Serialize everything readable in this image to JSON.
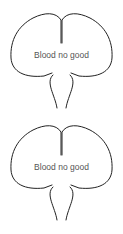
{
  "diagrams": [
    {
      "label": "Blood no good"
    },
    {
      "label": "Blood no good"
    }
  ],
  "colors": {
    "stroke": "#222222",
    "text": "#555555",
    "background": "#ffffff"
  }
}
